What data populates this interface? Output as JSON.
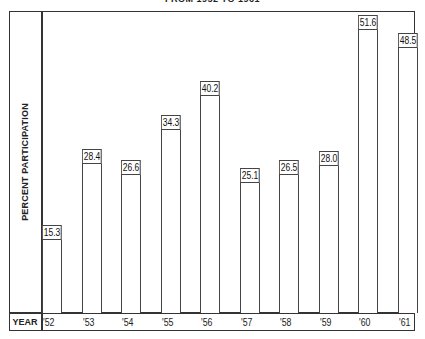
{
  "chart_data": {
    "type": "bar",
    "title": "FROM 1952 TO 1961",
    "xlabel": "YEAR",
    "ylabel": "PERCENT PARTICIPATION",
    "categories": [
      "'52",
      "'53",
      "'54",
      "'55",
      "'56",
      "'57",
      "'58",
      "'59",
      "'60",
      "'61"
    ],
    "values": [
      15.3,
      28.4,
      26.6,
      34.3,
      40.2,
      25.1,
      26.5,
      28.0,
      51.6,
      48.5
    ],
    "value_labels": [
      "15.3",
      "28.4",
      "26.6",
      "34.3",
      "40.2",
      "25.1",
      "26.5",
      "28.0",
      "51.6",
      "48.5"
    ],
    "ylim": [
      0,
      52
    ],
    "grid": false,
    "legend": null,
    "bar_fill": "#ffffff",
    "bar_stroke": "#444444"
  }
}
